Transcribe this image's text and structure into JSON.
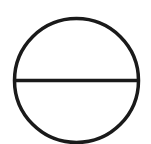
{
  "diagram": {
    "shape": "circle-with-horizontal-diameter",
    "background": "#ffffff",
    "stroke_color": "#1a1a1a",
    "stroke_width": 3.5,
    "circle": {
      "cx": 76.5,
      "cy": 80.5,
      "r": 62
    },
    "diameter_line": {
      "x1": 14.5,
      "y1": 80.5,
      "x2": 138.5,
      "y2": 80.5
    }
  }
}
